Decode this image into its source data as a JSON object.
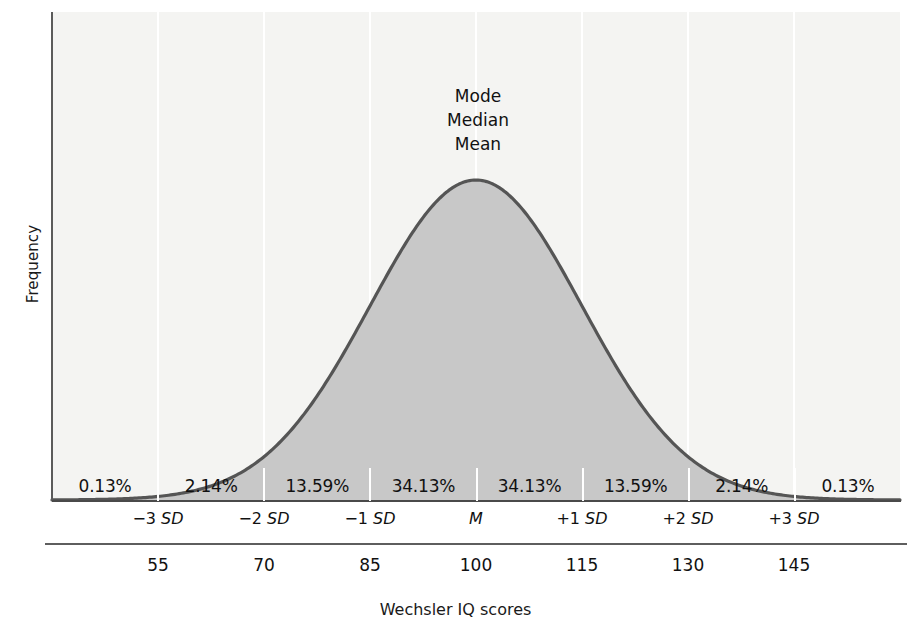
{
  "figure": {
    "title": "",
    "xlabel": "Wechsler IQ scores",
    "ylabel": "Frequency",
    "center_annotation": [
      "Mode",
      "Median",
      "Mean"
    ],
    "colors": {
      "plot_background": "#f4f4f2",
      "curve_stroke": "#555555",
      "area_fill": "#c8c8c8",
      "gridline": "#ffffff",
      "axis": "#5b5b5b",
      "text": "#111111"
    }
  },
  "chart_data": {
    "type": "area",
    "title": "",
    "xlabel": "Wechsler IQ scores",
    "ylabel": "Frequency",
    "distribution": "normal",
    "mean": 100,
    "sd": 15,
    "xlim": [
      47.5,
      152.5
    ],
    "grid": true,
    "legend": null,
    "sd_tick_labels": [
      "−3 SD",
      "−2 SD",
      "−1 SD",
      "M",
      "+1 SD",
      "+2 SD",
      "+3 SD"
    ],
    "sd_tick_z": [
      -3,
      -2,
      -1,
      0,
      1,
      2,
      3
    ],
    "iq_tick_labels": [
      "55",
      "70",
      "85",
      "100",
      "115",
      "130",
      "145"
    ],
    "iq_tick_values": [
      55,
      70,
      85,
      100,
      115,
      130,
      145
    ],
    "band_percent_labels": [
      "0.13%",
      "2.14%",
      "13.59%",
      "34.13%",
      "34.13%",
      "13.59%",
      "2.14%",
      "0.13%"
    ],
    "band_percent_values": [
      0.13,
      2.14,
      13.59,
      34.13,
      34.13,
      13.59,
      2.14,
      0.13
    ],
    "band_edges_z": [
      -4,
      -3,
      -2,
      -1,
      0,
      1,
      2,
      3,
      4
    ],
    "annotations": [
      {
        "text": "Mode",
        "at_x": 100
      },
      {
        "text": "Median",
        "at_x": 100
      },
      {
        "text": "Mean",
        "at_x": 100
      }
    ]
  }
}
